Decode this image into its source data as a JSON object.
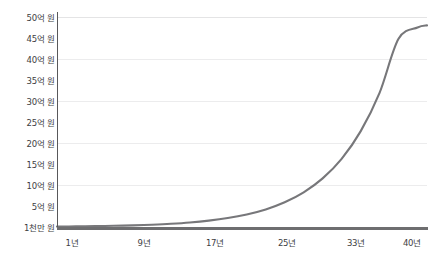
{
  "chart_data": {
    "type": "line",
    "title": "",
    "subtitle": "",
    "xlabel": "",
    "ylabel": "",
    "grid": true,
    "legend": null,
    "legend_position": "none",
    "line_color": "#77777a",
    "axis_color": "#58585a",
    "grid_color": "#ececed",
    "background_color": "#ffffff",
    "xlim": [
      1,
      40
    ],
    "ylim": [
      0.1,
      50
    ],
    "y_unit": "억 원",
    "y_tick_labels": [
      "50억 원",
      "45억 원",
      "40억 원",
      "35억 원",
      "30억 원",
      "25억 원",
      "20억 원",
      "15억 원",
      "10억 원",
      "5억 원",
      "1천만 원"
    ],
    "y_tick_values": [
      50,
      45,
      40,
      35,
      30,
      25,
      20,
      15,
      10,
      5,
      0.1
    ],
    "gridline_values": [
      50,
      40,
      30,
      20,
      10
    ],
    "x_tick_labels": [
      "1년",
      "9년",
      "17년",
      "25년",
      "33년",
      "40년"
    ],
    "x_tick_values": [
      1,
      9,
      17,
      25,
      33,
      40
    ],
    "series": [
      {
        "name": "복리 성장",
        "x": [
          1,
          3,
          5,
          7,
          9,
          11,
          13,
          15,
          17,
          19,
          21,
          23,
          25,
          27,
          29,
          31,
          33,
          35,
          37,
          39,
          40
        ],
        "values": [
          0.1,
          0.14,
          0.2,
          0.28,
          0.39,
          0.55,
          0.77,
          1.08,
          1.52,
          2.13,
          2.99,
          4.19,
          5.88,
          8.25,
          11.57,
          16.23,
          22.77,
          31.94,
          44.8,
          47.5,
          48.0
        ]
      }
    ]
  }
}
